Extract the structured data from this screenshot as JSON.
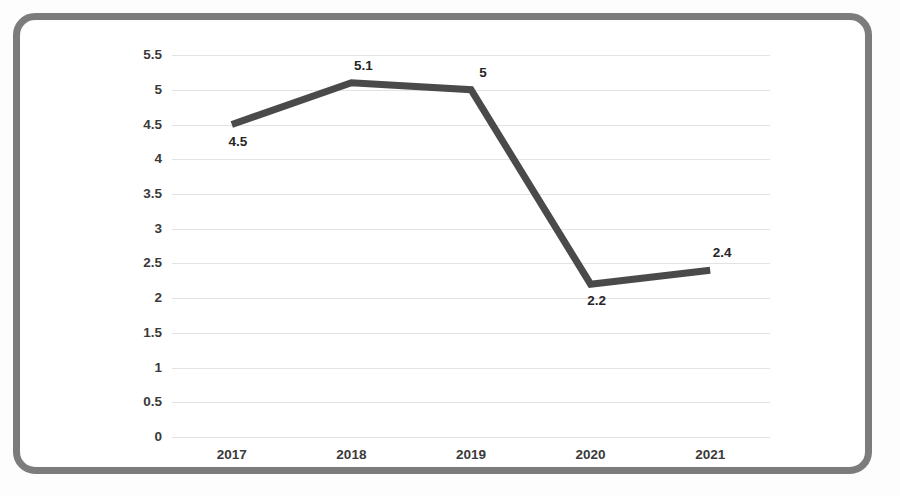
{
  "figure": {
    "frame_border_color": "#7c7c7c",
    "background_color": "#ffffff",
    "line_color": "#4a4a4a",
    "gridline_color": "#e3e3e3",
    "tick_text_color": "#3a3a3a",
    "data_label_color": "#262626"
  },
  "chart_data": {
    "type": "line",
    "title": "",
    "xlabel": "",
    "ylabel": "",
    "categories": [
      "2017",
      "2018",
      "2019",
      "2020",
      "2021"
    ],
    "values": [
      4.5,
      5.1,
      5,
      2.2,
      2.4
    ],
    "data_labels": [
      "4.5",
      "5.1",
      "5",
      "2.2",
      "2.4"
    ],
    "series": [
      {
        "name": "",
        "values": [
          4.5,
          5.1,
          5,
          2.2,
          2.4
        ]
      }
    ],
    "ylim": [
      0,
      5.5
    ],
    "ytick_step": 0.5,
    "ytick_labels": [
      "5.5",
      "5",
      "4.5",
      "4",
      "3.5",
      "3",
      "2.5",
      "2",
      "1.5",
      "1",
      "0.5",
      "0"
    ],
    "ytick_values": [
      5.5,
      5,
      4.5,
      4,
      3.5,
      3,
      2.5,
      2,
      1.5,
      1,
      0.5,
      0
    ],
    "grid": true,
    "grid_axis": "y",
    "legend": false,
    "legend_position": "none",
    "markers": false,
    "line_width_px": 7
  }
}
